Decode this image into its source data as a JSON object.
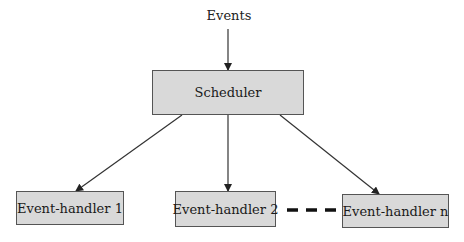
{
  "diagram": {
    "input_label": "Events",
    "scheduler": {
      "label": "Scheduler"
    },
    "handlers": [
      {
        "label": "Event-handler 1"
      },
      {
        "label": "Event-handler 2"
      },
      {
        "label": "Event-handler n"
      }
    ],
    "ellipsis": "dashed-connector",
    "colors": {
      "box_fill": "#d9d9d9",
      "box_border": "#555555",
      "line": "#333333"
    }
  }
}
